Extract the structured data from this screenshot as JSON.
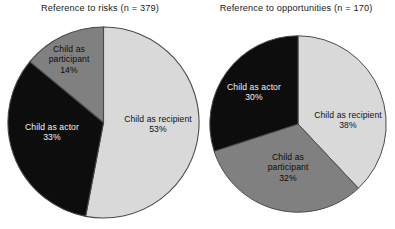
{
  "figure": {
    "background": "#ffffff",
    "palette": {
      "light_gray": "#d9d9d9",
      "medium_gray": "#808080",
      "black": "#0d0d0d",
      "outline": "#4a4a4a",
      "label_on_dark": "#f2f2f2",
      "label_on_light": "#101010"
    }
  },
  "chart_data": [
    {
      "type": "pie",
      "id": "reference-to-risks",
      "title": "Reference to risks (n = 379)",
      "n": 379,
      "xlabel": "",
      "ylabel": "",
      "legend": "none",
      "grid": false,
      "start_angle_deg": 0,
      "direction": "clockwise",
      "categories": [
        "Child as recipient",
        "Child as actor",
        "Child as participant"
      ],
      "values": [
        53,
        33,
        14
      ],
      "units": "percent",
      "slices": [
        {
          "label": "Child as recipient",
          "value": 53,
          "value_text": "53%",
          "color": "#d9d9d9"
        },
        {
          "label": "Child as actor",
          "value": 33,
          "value_text": "33%",
          "color": "#0d0d0d"
        },
        {
          "label": "Child as participant",
          "value": 14,
          "value_text": "14%",
          "color": "#808080"
        }
      ]
    },
    {
      "type": "pie",
      "id": "reference-to-opportunities",
      "title": "Reference to opportunities (n = 170)",
      "n": 170,
      "xlabel": "",
      "ylabel": "",
      "legend": "none",
      "grid": false,
      "start_angle_deg": 0,
      "direction": "clockwise",
      "categories": [
        "Child as recipient",
        "Child as participant",
        "Child as actor"
      ],
      "values": [
        38,
        32,
        30
      ],
      "units": "percent",
      "slices": [
        {
          "label": "Child as recipient",
          "value": 38,
          "value_text": "38%",
          "color": "#d9d9d9"
        },
        {
          "label": "Child as participant",
          "value": 32,
          "value_text": "32%",
          "color": "#808080"
        },
        {
          "label": "Child as actor",
          "value": 30,
          "value_text": "30%",
          "color": "#0d0d0d"
        }
      ]
    }
  ],
  "labels": {
    "risks": {
      "recipient_name": "Child as recipient",
      "recipient_pct": "53%",
      "actor_name": "Child as actor",
      "actor_pct": "33%",
      "participant_name_line1": "Child as",
      "participant_name_line2": "participant",
      "participant_pct": "14%"
    },
    "opportunities": {
      "recipient_name": "Child as recipient",
      "recipient_pct": "38%",
      "actor_name": "Child as actor",
      "actor_pct": "30%",
      "participant_name_line1": "Child as",
      "participant_name_line2": "participant",
      "participant_pct": "32%"
    }
  }
}
